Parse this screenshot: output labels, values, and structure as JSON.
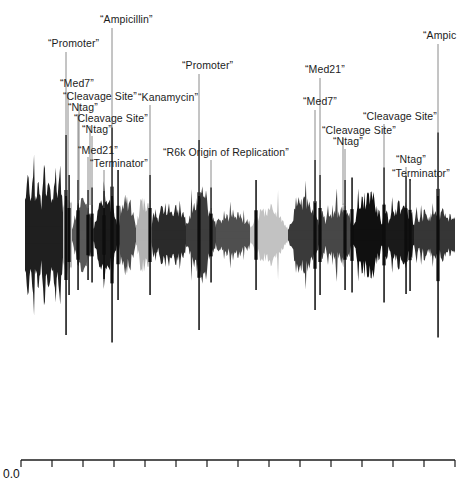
{
  "figure": {
    "kind": "sequence-waveform",
    "background": "#ffffff",
    "ink": "#1c1c1c"
  },
  "axis": {
    "origin_label": "0.0",
    "tick_count": 15,
    "x_start": 21,
    "x_end": 455,
    "tick_spacing": 31
  },
  "annotations": [
    {
      "id": "a1",
      "text": "“Promoter”",
      "x": 48,
      "y": 38,
      "leader_x": 66,
      "leader_y1": 52,
      "leader_y2": 196
    },
    {
      "id": "a2",
      "text": "“Ampicillin”",
      "x": 100,
      "y": 14,
      "leader_x": 112,
      "leader_y1": 28,
      "leader_y2": 196
    },
    {
      "id": "a3",
      "text": "“Med7”",
      "x": 60,
      "y": 78,
      "leader_x": 68,
      "leader_y1": 92,
      "leader_y2": 200
    },
    {
      "id": "a4",
      "text": "“Cleavage Site”",
      "x": 63,
      "y": 91,
      "leader_x": 79,
      "leader_y1": 104,
      "leader_y2": 200
    },
    {
      "id": "a5",
      "text": "“Ntag”",
      "x": 68,
      "y": 102,
      "leader_x": 78,
      "leader_y1": 114,
      "leader_y2": 203
    },
    {
      "id": "a6",
      "text": "“Cleavage Site”",
      "x": 74,
      "y": 113,
      "leader_x": 90,
      "leader_y1": 126,
      "leader_y2": 205
    },
    {
      "id": "a7",
      "text": "“Ntag”",
      "x": 82,
      "y": 124,
      "leader_x": 92,
      "leader_y1": 136,
      "leader_y2": 205
    },
    {
      "id": "a8",
      "text": "“Kanamycin”",
      "x": 138,
      "y": 92,
      "leader_x": 150,
      "leader_y1": 105,
      "leader_y2": 200
    },
    {
      "id": "a9",
      "text": "“Med21”",
      "x": 78,
      "y": 145,
      "leader_x": 88,
      "leader_y1": 157,
      "leader_y2": 208
    },
    {
      "id": "a10",
      "text": "“Terminator”",
      "x": 90,
      "y": 158,
      "leader_x": 104,
      "leader_y1": 170,
      "leader_y2": 208
    },
    {
      "id": "a11",
      "text": "“Promoter”",
      "x": 182,
      "y": 60,
      "leader_x": 199,
      "leader_y1": 74,
      "leader_y2": 196
    },
    {
      "id": "a12",
      "text": "“R6k Origin of Replication”",
      "x": 163,
      "y": 147,
      "leader_x": 211,
      "leader_y1": 160,
      "leader_y2": 208
    },
    {
      "id": "a13",
      "text": "“Med21”",
      "x": 305,
      "y": 64,
      "leader_x": 320,
      "leader_y1": 78,
      "leader_y2": 200
    },
    {
      "id": "a14",
      "text": "“Med7”",
      "x": 303,
      "y": 96,
      "leader_x": 315,
      "leader_y1": 110,
      "leader_y2": 203
    },
    {
      "id": "a15",
      "text": "“Cleavage Site”",
      "x": 322,
      "y": 125,
      "leader_x": 343,
      "leader_y1": 138,
      "leader_y2": 205
    },
    {
      "id": "a16",
      "text": "“Ntag”",
      "x": 333,
      "y": 136,
      "leader_x": 345,
      "leader_y1": 149,
      "leader_y2": 206
    },
    {
      "id": "a17",
      "text": "“Cleavage Site”",
      "x": 363,
      "y": 111,
      "leader_x": 384,
      "leader_y1": 124,
      "leader_y2": 203
    },
    {
      "id": "a18",
      "text": "“Ntag”",
      "x": 396,
      "y": 154,
      "leader_x": 406,
      "leader_y1": 167,
      "leader_y2": 208
    },
    {
      "id": "a19",
      "text": "“Terminator”",
      "x": 392,
      "y": 168,
      "leader_x": 410,
      "leader_y1": 181,
      "leader_y2": 210
    },
    {
      "id": "a20",
      "text": "“Ampic",
      "x": 423,
      "y": 30,
      "leader_x": 438,
      "leader_y1": 44,
      "leader_y2": 196
    }
  ],
  "chart_data": {
    "type": "area",
    "title": "",
    "xlabel": "",
    "ylabel": "",
    "baseline_y": 235,
    "xlim": [
      21,
      455
    ],
    "ylim": [
      -120,
      120
    ],
    "grid": false,
    "legend": "none",
    "shades": [
      "#111111",
      "#2e2e2e",
      "#474747",
      "#5e5e5e",
      "#7d7d7d",
      "#9c9c9c",
      "#b9b9b9",
      "#cfcfcf"
    ],
    "segments": [
      {
        "start": 25,
        "end": 63,
        "shade": "#1f1f1f",
        "amp": 72,
        "texture": "comb"
      },
      {
        "start": 63,
        "end": 72,
        "shade": "#bdbdbd",
        "amp": 46,
        "texture": "block"
      },
      {
        "start": 72,
        "end": 94,
        "shade": "#5a5a5a",
        "amp": 40,
        "texture": "lens"
      },
      {
        "start": 94,
        "end": 118,
        "shade": "#1b1b1b",
        "amp": 46,
        "texture": "lens"
      },
      {
        "start": 118,
        "end": 136,
        "shade": "#4a4a4a",
        "amp": 42,
        "texture": "lens"
      },
      {
        "start": 136,
        "end": 152,
        "shade": "#b2b2b2",
        "amp": 44,
        "texture": "lens"
      },
      {
        "start": 152,
        "end": 186,
        "shade": "#2a2a2a",
        "amp": 38,
        "texture": "rough"
      },
      {
        "start": 186,
        "end": 216,
        "shade": "#3d3d3d",
        "amp": 44,
        "texture": "lens"
      },
      {
        "start": 216,
        "end": 250,
        "shade": "#4f4f4f",
        "amp": 30,
        "texture": "rough"
      },
      {
        "start": 250,
        "end": 288,
        "shade": "#c2c2c2",
        "amp": 32,
        "texture": "lens"
      },
      {
        "start": 288,
        "end": 320,
        "shade": "#3a3a3a",
        "amp": 40,
        "texture": "lens"
      },
      {
        "start": 320,
        "end": 352,
        "shade": "#474747",
        "amp": 38,
        "texture": "rough"
      },
      {
        "start": 352,
        "end": 384,
        "shade": "#101010",
        "amp": 46,
        "texture": "lens"
      },
      {
        "start": 384,
        "end": 414,
        "shade": "#1a1a1a",
        "amp": 40,
        "texture": "rough"
      },
      {
        "start": 414,
        "end": 455,
        "shade": "#363636",
        "amp": 34,
        "texture": "rough"
      }
    ],
    "spikes": [
      {
        "x": 66,
        "height": 200
      },
      {
        "x": 69,
        "height": 120
      },
      {
        "x": 78,
        "height": 110
      },
      {
        "x": 88,
        "height": 90
      },
      {
        "x": 92,
        "height": 95
      },
      {
        "x": 104,
        "height": 88
      },
      {
        "x": 112,
        "height": 215
      },
      {
        "x": 118,
        "height": 130
      },
      {
        "x": 150,
        "height": 120
      },
      {
        "x": 199,
        "height": 190
      },
      {
        "x": 211,
        "height": 95
      },
      {
        "x": 256,
        "height": 110
      },
      {
        "x": 315,
        "height": 150
      },
      {
        "x": 320,
        "height": 120
      },
      {
        "x": 345,
        "height": 110
      },
      {
        "x": 352,
        "height": 115
      },
      {
        "x": 384,
        "height": 135
      },
      {
        "x": 406,
        "height": 118
      },
      {
        "x": 410,
        "height": 112
      },
      {
        "x": 438,
        "height": 205
      }
    ]
  }
}
